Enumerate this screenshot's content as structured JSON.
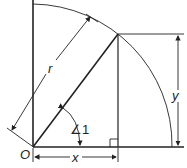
{
  "diagram": {
    "type": "unit-circle-quadrant",
    "labels": {
      "origin": "O",
      "radius": "r",
      "x": "x",
      "y": "y",
      "angle": "∠1"
    },
    "colors": {
      "stroke": "#222222",
      "background": "#ffffff"
    }
  }
}
